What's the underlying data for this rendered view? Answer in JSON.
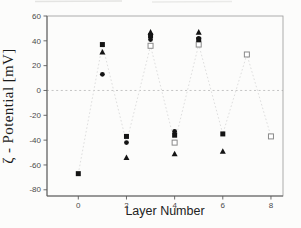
{
  "figure": {
    "ylabel": "ζ - Potential [mV]",
    "xlabel": "Layer Number"
  },
  "chart_data": {
    "type": "scatter",
    "title": "",
    "xlabel": "Layer Number",
    "ylabel": "ζ - Potential [mV]",
    "x_axis": {
      "min": -1.3,
      "max": 8.5,
      "ticks": [
        0,
        2,
        4,
        6,
        8
      ]
    },
    "y_axis": {
      "min": -85,
      "max": 60,
      "ticks": [
        60,
        40,
        20,
        0,
        -20,
        -40,
        -60,
        -80
      ]
    },
    "zero_line": {
      "value": 0,
      "style": "dashed",
      "color": "#bdbdbd"
    },
    "grid": false,
    "legend": "none",
    "marker_color": "#141414",
    "open_marker_stroke": "#8a8a8a",
    "connector_color": "#dedede",
    "series": [
      {
        "name": "open-square-connected",
        "marker": "open-square",
        "line": true,
        "line_points": [
          [
            0,
            -67
          ],
          [
            1,
            37
          ],
          [
            2,
            -42
          ],
          [
            3,
            36
          ],
          [
            4,
            -42
          ],
          [
            5,
            37
          ],
          [
            6,
            -35
          ],
          [
            7,
            29
          ],
          [
            8,
            -37
          ]
        ],
        "points": [
          [
            3,
            36
          ],
          [
            4,
            -42
          ],
          [
            5,
            37
          ],
          [
            7,
            29
          ],
          [
            8,
            -37
          ]
        ]
      },
      {
        "name": "filled-square",
        "marker": "square",
        "line": false,
        "points": [
          [
            0,
            -67
          ],
          [
            1,
            37
          ],
          [
            2,
            -37
          ],
          [
            3,
            44
          ],
          [
            4,
            -36
          ],
          [
            5,
            41
          ],
          [
            6,
            -35
          ]
        ]
      },
      {
        "name": "filled-circle",
        "marker": "circle",
        "line": false,
        "points": [
          [
            1,
            13
          ],
          [
            2,
            -42
          ],
          [
            3,
            41
          ],
          [
            4,
            -33
          ],
          [
            5,
            42
          ]
        ]
      },
      {
        "name": "filled-triangle",
        "marker": "triangle",
        "line": false,
        "points": [
          [
            1,
            31
          ],
          [
            2,
            -54
          ],
          [
            3,
            47
          ],
          [
            4,
            -51
          ],
          [
            5,
            47
          ],
          [
            6,
            -49
          ]
        ]
      }
    ]
  }
}
